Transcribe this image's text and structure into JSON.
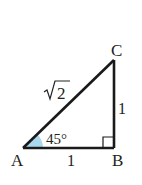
{
  "diagram": {
    "type": "right-triangle",
    "vertices": {
      "A": {
        "label": "A",
        "x": 23,
        "y": 148
      },
      "B": {
        "label": "B",
        "x": 114,
        "y": 148
      },
      "C": {
        "label": "C",
        "x": 114,
        "y": 60
      }
    },
    "sides": {
      "AB": {
        "label": "1"
      },
      "BC": {
        "label": "1"
      },
      "AC": {
        "label": "√2",
        "radicand": "2"
      }
    },
    "angles": {
      "A": {
        "label": "45°",
        "fill": "#a9d8ee"
      },
      "B": {
        "marker": "right-angle"
      }
    },
    "colors": {
      "stroke": "#1a1a1a",
      "angle_fill": "#a9d8ee",
      "text": "#222222"
    }
  }
}
